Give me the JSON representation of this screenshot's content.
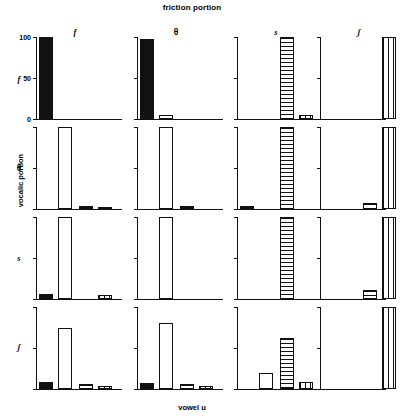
{
  "titles": {
    "top": "friction portion",
    "bottom": "vowel u",
    "y_axis": "vocalic portion"
  },
  "axis": {
    "tick_labels": [
      "100",
      "50",
      "0"
    ],
    "tick_values": [
      100,
      50,
      0
    ],
    "ylim": [
      0,
      100
    ]
  },
  "columns": [
    {
      "key": "f",
      "label": "f"
    },
    {
      "key": "th",
      "label": "θ"
    },
    {
      "key": "s",
      "label": "s"
    },
    {
      "key": "sh",
      "label": "ʃ"
    }
  ],
  "rows": [
    {
      "key": "f",
      "label": "f"
    },
    {
      "key": "th",
      "label": "θ"
    },
    {
      "key": "s",
      "label": "s"
    },
    {
      "key": "sh",
      "label": "ʃ"
    }
  ],
  "fills": {
    "f": "solid",
    "th": "open",
    "s": "hstripe",
    "sh": "vstripe"
  },
  "chart_data": {
    "type": "bar",
    "title": "friction portion",
    "xlabel": "vowel u",
    "ylabel": "vocalic portion",
    "ylim": [
      0,
      100
    ],
    "grid": false,
    "legend": "none",
    "categories": [
      "f",
      "θ",
      "s",
      "ʃ"
    ],
    "row_categories": [
      "f",
      "θ",
      "s",
      "ʃ"
    ],
    "panels": [
      {
        "row": "f",
        "col": "f",
        "values": [
          100,
          0,
          0,
          0
        ]
      },
      {
        "row": "f",
        "col": "θ",
        "values": [
          97,
          5,
          0,
          0
        ]
      },
      {
        "row": "f",
        "col": "s",
        "values": [
          0,
          0,
          100,
          5
        ]
      },
      {
        "row": "f",
        "col": "ʃ",
        "values": [
          0,
          0,
          0,
          100
        ]
      },
      {
        "row": "θ",
        "col": "f",
        "values": [
          0,
          100,
          4,
          3
        ]
      },
      {
        "row": "θ",
        "col": "θ",
        "values": [
          0,
          100,
          4,
          0
        ]
      },
      {
        "row": "θ",
        "col": "s",
        "values": [
          4,
          0,
          100,
          0
        ]
      },
      {
        "row": "θ",
        "col": "ʃ",
        "values": [
          0,
          0,
          7,
          100
        ]
      },
      {
        "row": "s",
        "col": "f",
        "values": [
          6,
          100,
          0,
          5
        ]
      },
      {
        "row": "s",
        "col": "θ",
        "values": [
          0,
          100,
          0,
          0
        ]
      },
      {
        "row": "s",
        "col": "s",
        "values": [
          0,
          0,
          100,
          0
        ]
      },
      {
        "row": "s",
        "col": "ʃ",
        "values": [
          0,
          0,
          11,
          100
        ]
      },
      {
        "row": "ʃ",
        "col": "f",
        "values": [
          9,
          75,
          6,
          4
        ]
      },
      {
        "row": "ʃ",
        "col": "θ",
        "values": [
          7,
          80,
          6,
          4
        ]
      },
      {
        "row": "ʃ",
        "col": "s",
        "values": [
          0,
          20,
          62,
          9
        ]
      },
      {
        "row": "ʃ",
        "col": "ʃ",
        "values": [
          0,
          0,
          0,
          100
        ]
      }
    ]
  }
}
